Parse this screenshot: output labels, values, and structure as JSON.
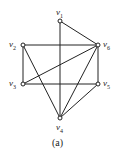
{
  "caption": "(a)",
  "graph": {
    "nodes": [
      {
        "id": "v1",
        "name": "v",
        "sub": "1",
        "x": 60,
        "y": 21
      },
      {
        "id": "v2",
        "name": "v",
        "sub": "2",
        "x": 23,
        "y": 45
      },
      {
        "id": "v3",
        "name": "v",
        "sub": "3",
        "x": 23,
        "y": 84
      },
      {
        "id": "v4",
        "name": "v",
        "sub": "4",
        "x": 60,
        "y": 118
      },
      {
        "id": "v5",
        "name": "v",
        "sub": "5",
        "x": 98,
        "y": 84
      },
      {
        "id": "v6",
        "name": "v",
        "sub": "6",
        "x": 98,
        "y": 45
      }
    ],
    "edges": [
      [
        "v1",
        "v4"
      ],
      [
        "v1",
        "v6"
      ],
      [
        "v2",
        "v6"
      ],
      [
        "v2",
        "v3"
      ],
      [
        "v2",
        "v4"
      ],
      [
        "v3",
        "v6"
      ],
      [
        "v3",
        "v5"
      ],
      [
        "v6",
        "v5"
      ],
      [
        "v6",
        "v4"
      ],
      [
        "v5",
        "v4"
      ]
    ]
  }
}
